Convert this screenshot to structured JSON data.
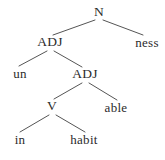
{
  "figure": {
    "type": "syntax-tree",
    "width": 165,
    "height": 160,
    "background_color": "#ffffff",
    "text_color": "#2b2b2b",
    "edge_color": "#555555"
  },
  "nodes": [
    {
      "id": "n-root",
      "label": "N",
      "kind": "nonterminal",
      "x": 99,
      "y": 12,
      "depth": 0
    },
    {
      "id": "adj-1",
      "label": "ADJ",
      "kind": "nonterminal",
      "x": 50,
      "y": 42,
      "depth": 1
    },
    {
      "id": "ness",
      "label": "ness",
      "kind": "terminal",
      "x": 147,
      "y": 42,
      "depth": 1
    },
    {
      "id": "un",
      "label": "un",
      "kind": "terminal",
      "x": 20,
      "y": 73,
      "depth": 2
    },
    {
      "id": "adj-2",
      "label": "ADJ",
      "kind": "nonterminal",
      "x": 85,
      "y": 74,
      "depth": 2
    },
    {
      "id": "v-1",
      "label": "V",
      "kind": "nonterminal",
      "x": 52,
      "y": 106,
      "depth": 3
    },
    {
      "id": "able",
      "label": "able",
      "kind": "terminal",
      "x": 116,
      "y": 107,
      "depth": 3
    },
    {
      "id": "in",
      "label": "in",
      "kind": "terminal",
      "x": 20,
      "y": 139,
      "depth": 4
    },
    {
      "id": "habit",
      "label": "habit",
      "kind": "terminal",
      "x": 84,
      "y": 139,
      "depth": 4
    }
  ],
  "edges": [
    {
      "id": "e-root-adj1",
      "from": "n-root",
      "to": "adj-1",
      "x1": 95,
      "y1": 20,
      "x2": 53,
      "y2": 35
    },
    {
      "id": "e-root-ness",
      "from": "n-root",
      "to": "ness",
      "x1": 103,
      "y1": 20,
      "x2": 143,
      "y2": 35
    },
    {
      "id": "e-adj1-un",
      "from": "adj-1",
      "to": "un",
      "x1": 47,
      "y1": 51,
      "x2": 19,
      "y2": 66
    },
    {
      "id": "e-adj1-adj2",
      "from": "adj-1",
      "to": "adj-2",
      "x1": 54,
      "y1": 51,
      "x2": 82,
      "y2": 67
    },
    {
      "id": "e-adj2-v",
      "from": "adj-2",
      "to": "v-1",
      "x1": 82,
      "y1": 83,
      "x2": 54,
      "y2": 99
    },
    {
      "id": "e-adj2-able",
      "from": "adj-2",
      "to": "able",
      "x1": 89,
      "y1": 83,
      "x2": 117,
      "y2": 100
    },
    {
      "id": "e-v-in",
      "from": "v-1",
      "to": "in",
      "x1": 49,
      "y1": 115,
      "x2": 20,
      "y2": 132
    },
    {
      "id": "e-v-habit",
      "from": "v-1",
      "to": "habit",
      "x1": 56,
      "y1": 115,
      "x2": 85,
      "y2": 132
    }
  ]
}
